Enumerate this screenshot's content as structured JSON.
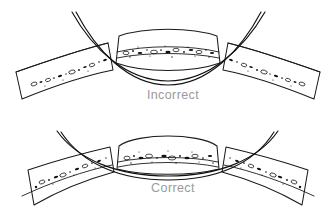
{
  "figure": {
    "background_color": "#ffffff",
    "ink_color": "#1a1a1a",
    "caption_color": "#9a9a9a",
    "panels": [
      {
        "id": "top",
        "caption": "Incorrect",
        "caption_x": 173,
        "caption_y": 99,
        "description": "Deeply curved band dips below the central block and does not contact it",
        "wire": {
          "name": "curved-band",
          "left_end": [
            72,
            12
          ],
          "right_end": [
            265,
            12
          ],
          "lowest_point_y": 81,
          "shape": "deep-u-curve",
          "contacts_center_block": false
        },
        "center_block": {
          "name": "center-segment",
          "x": 118,
          "y": 26,
          "width": 100,
          "height": 44,
          "top_edge": "convex-up",
          "bottom_edge": "convex-down",
          "texture_band_y": 48
        },
        "left_segment": {
          "name": "left-segment",
          "tilt": "up-to-the-right",
          "rotation_deg": -12
        },
        "right_segment": {
          "name": "right-segment",
          "tilt": "down-to-the-right",
          "rotation_deg": 12
        }
      },
      {
        "id": "bottom",
        "caption": "Correct",
        "caption_x": 173,
        "caption_y": 192,
        "description": "Shallow curved band seats flush against the base of the central block",
        "wire": {
          "name": "curved-band",
          "left_end": [
            57,
            131
          ],
          "right_end": [
            278,
            131
          ],
          "lowest_point_y": 176,
          "shape": "shallow-arc",
          "contacts_center_block": true
        },
        "center_block": {
          "name": "center-segment",
          "x": 118,
          "y": 134,
          "width": 100,
          "height": 42,
          "top_edge": "rounded",
          "bottom_edge": "flat",
          "texture_band_y": 155
        },
        "left_segment": {
          "name": "left-segment",
          "tilt": "down-to-the-left",
          "rotation_deg": 12
        },
        "right_segment": {
          "name": "right-segment",
          "tilt": "down-to-the-right",
          "rotation_deg": -12
        }
      }
    ]
  }
}
